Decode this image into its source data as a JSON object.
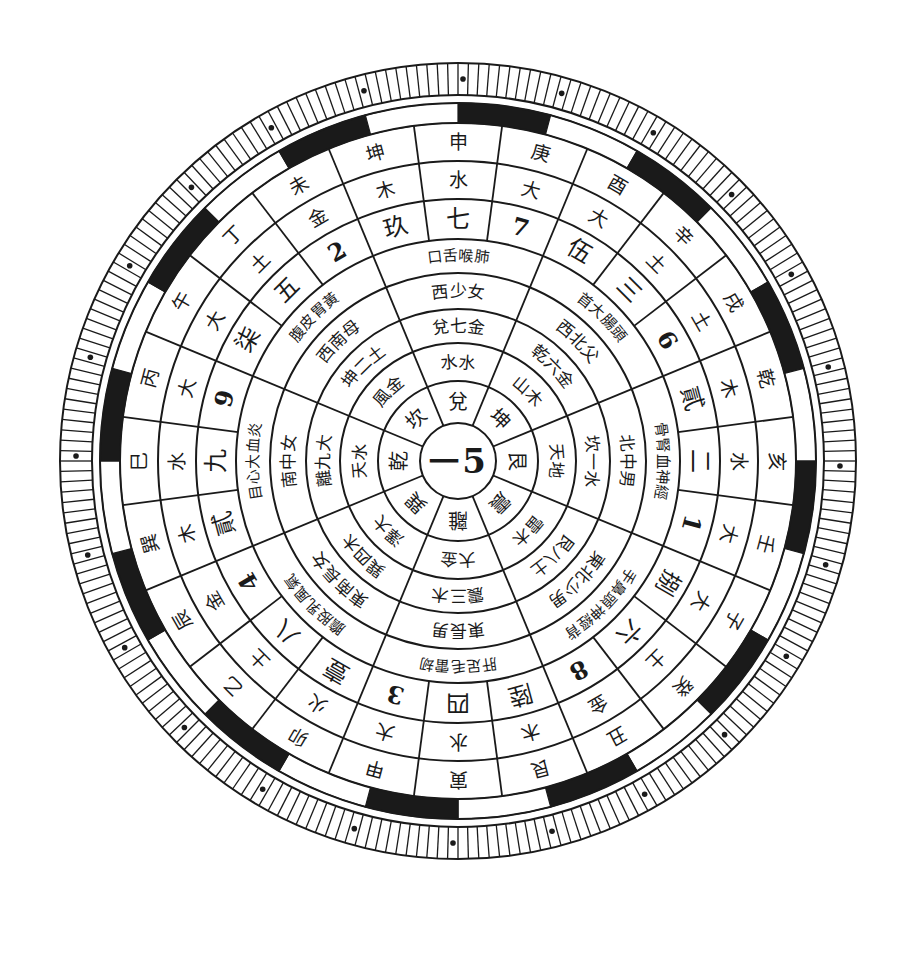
{
  "diagram": {
    "title": "",
    "center": {
      "cx": 458,
      "cy": 461,
      "text_left": "一",
      "text_right": "5"
    },
    "colors": {
      "ink": "#1a1a1a",
      "paper": "#ffffff"
    },
    "rings": [
      {
        "id": "trigrams",
        "r_in": 38,
        "r_out": 80,
        "offset_deg": -90,
        "size": 20,
        "items": [
          "離",
          "巽",
          "乾",
          "坎",
          "兌",
          "坤",
          "艮",
          "震"
        ]
      },
      {
        "id": "ring2",
        "r_in": 80,
        "r_out": 118,
        "offset_deg": -90,
        "size": 17,
        "items": [
          "大金",
          "澤大",
          "天水",
          "風金",
          "水水",
          "山木",
          "天地",
          "雷木"
        ]
      },
      {
        "id": "ring3",
        "r_in": 118,
        "r_out": 152,
        "offset_deg": -90,
        "size": 17,
        "items": [
          "震三木",
          "巽四木",
          "離九大",
          "坤二土",
          "兌七金",
          "乾六金",
          "坎一水",
          "艮八土"
        ]
      },
      {
        "id": "ring4",
        "r_in": 152,
        "r_out": 188,
        "offset_deg": -90,
        "size": 17,
        "items": [
          "東長男",
          "東南長女",
          "南中女",
          "西南母",
          "西少女",
          "西北父",
          "北中男",
          "東北少男"
        ]
      },
      {
        "id": "ring5",
        "r_in": 188,
        "r_out": 222,
        "offset_deg": -90,
        "size": 15,
        "items": [
          "肝足毛雷刼",
          "膽股乳風氣",
          "目心大血炎",
          "腹皮胃黃",
          "口舌喉肺",
          "首大腸頭",
          "骨腎血神經",
          "手鼻頭神經背"
        ]
      }
    ],
    "ring_numbers": {
      "r_in": 222,
      "r_out": 262,
      "offset_deg": -90,
      "size": 24,
      "sectors": [
        {
          "label": "3",
          "type": "numeral"
        },
        {
          "label": "四",
          "type": "glyph"
        },
        {
          "label": "陸",
          "type": "glyph"
        },
        {
          "label": "8",
          "type": "numeral"
        },
        {
          "label": "六",
          "type": "glyph"
        },
        {
          "label": "捌",
          "type": "glyph"
        },
        {
          "label": "1",
          "type": "numeral"
        },
        {
          "label": "二",
          "type": "glyph"
        },
        {
          "label": "貳",
          "type": "glyph"
        },
        {
          "label": "6",
          "type": "numeral"
        },
        {
          "label": "三",
          "type": "glyph"
        },
        {
          "label": "伍",
          "type": "glyph"
        },
        {
          "label": "7",
          "type": "numeral"
        },
        {
          "label": "七",
          "type": "glyph"
        },
        {
          "label": "玖",
          "type": "glyph"
        },
        {
          "label": "2",
          "type": "numeral"
        },
        {
          "label": "五",
          "type": "glyph"
        },
        {
          "label": "柒",
          "type": "glyph"
        },
        {
          "label": "9",
          "type": "numeral"
        },
        {
          "label": "九",
          "type": "glyph"
        },
        {
          "label": "貳",
          "type": "glyph"
        },
        {
          "label": "4",
          "type": "numeral"
        },
        {
          "label": "八",
          "type": "glyph"
        },
        {
          "label": "壹",
          "type": "glyph"
        }
      ]
    },
    "ring_elements": {
      "r_in": 262,
      "r_out": 300,
      "offset_deg": -90,
      "size": 19,
      "items": [
        "大",
        "水",
        "木",
        "金",
        "土",
        "大",
        "大",
        "水",
        "木",
        "土",
        "土",
        "大",
        "大",
        "水",
        "木",
        "金",
        "土",
        "大",
        "大",
        "水",
        "木",
        "金",
        "土",
        "火"
      ]
    },
    "ring_mountains": {
      "r_in": 300,
      "r_out": 338,
      "offset_deg": -90,
      "size": 19,
      "items": [
        "甲",
        "寅",
        "艮",
        "丑",
        "癸",
        "子",
        "壬",
        "亥",
        "乾",
        "戌",
        "辛",
        "酉",
        "庚",
        "申",
        "坤",
        "未",
        "丁",
        "午",
        "丙",
        "巳",
        "巽",
        "辰",
        "乙",
        "卯"
      ]
    },
    "ring_bar": {
      "r_in": 338,
      "r_out": 358,
      "pattern": [
        1,
        0,
        1,
        0,
        1,
        0,
        1,
        0,
        1,
        0,
        1,
        0,
        1,
        0,
        1,
        0,
        1,
        0,
        1,
        0,
        1,
        0,
        1,
        0
      ]
    },
    "ring_ticks": {
      "r_in": 358,
      "r_out": 398,
      "count": 240,
      "dots_every": 10
    }
  }
}
